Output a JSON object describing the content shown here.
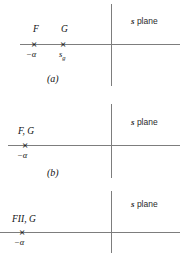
{
  "figure": {
    "panels": [
      {
        "id": "panel-a",
        "plane_label_symbol": "s",
        "plane_label_text": " plane",
        "poles": [
          {
            "mark": "×",
            "top_label": "F",
            "bottom_label": "−α"
          },
          {
            "mark": "×",
            "top_label": "G",
            "bottom_label_base": "s",
            "bottom_label_sub": "g"
          }
        ],
        "caption": "(a)"
      },
      {
        "id": "panel-b",
        "plane_label_symbol": "s",
        "plane_label_text": " plane",
        "poles": [
          {
            "mark": "×",
            "top_label": "F, G",
            "bottom_label": "−α"
          }
        ],
        "caption": "(b)"
      },
      {
        "id": "panel-c",
        "plane_label_symbol": "s",
        "plane_label_text": " plane",
        "poles": [
          {
            "mark": "×",
            "top_label": "FII, G",
            "bottom_label": "−α"
          }
        ],
        "caption": ""
      }
    ]
  },
  "colors": {
    "axis": "#7d7d7d",
    "ink": "#111111",
    "background": "#ffffff"
  }
}
